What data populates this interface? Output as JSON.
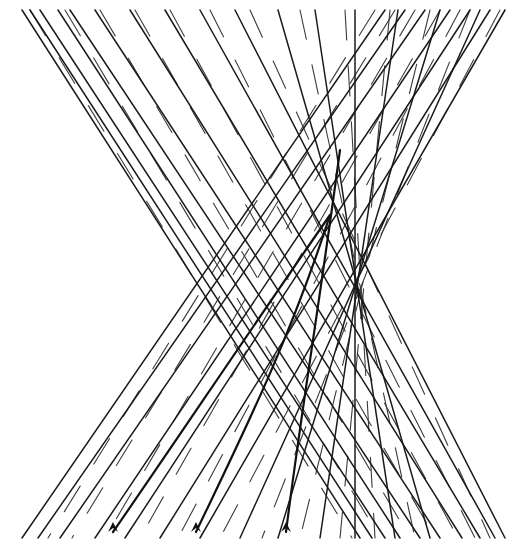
{
  "figure": {
    "title": "Hyperboloid of one sheet as a ruled surface",
    "width": 524,
    "height": 560,
    "top_y": 10,
    "bottom_y": 538,
    "waist_y": 278,
    "colors": {
      "line": "#1a1a1a",
      "background": "#ffffff"
    },
    "front_rulings": [
      [
        22,
        10,
        360,
        538
      ],
      [
        30,
        10,
        372,
        538
      ],
      [
        40,
        10,
        385,
        538
      ],
      [
        58,
        10,
        400,
        538
      ],
      [
        70,
        10,
        420,
        538
      ],
      [
        95,
        10,
        440,
        538
      ],
      [
        130,
        10,
        462,
        538
      ],
      [
        165,
        10,
        480,
        538
      ],
      [
        200,
        10,
        495,
        538
      ],
      [
        235,
        10,
        505,
        538
      ],
      [
        278,
        10,
        430,
        538
      ],
      [
        315,
        10,
        395,
        538
      ],
      [
        355,
        10,
        355,
        538
      ],
      [
        398,
        10,
        320,
        538
      ],
      [
        440,
        10,
        278,
        538
      ],
      [
        480,
        10,
        240,
        538
      ],
      [
        505,
        10,
        200,
        538
      ],
      [
        490,
        10,
        160,
        538
      ],
      [
        470,
        10,
        125,
        538
      ],
      [
        450,
        10,
        95,
        538
      ],
      [
        425,
        10,
        60,
        538
      ],
      [
        405,
        10,
        38,
        538
      ],
      [
        385,
        10,
        22,
        538
      ]
    ],
    "back_rulings": [
      [
        30,
        10,
        352,
        538
      ],
      [
        65,
        10,
        380,
        538
      ],
      [
        100,
        10,
        410,
        538
      ],
      [
        135,
        10,
        435,
        538
      ],
      [
        170,
        10,
        458,
        538
      ],
      [
        210,
        10,
        475,
        538
      ],
      [
        250,
        10,
        490,
        538
      ],
      [
        300,
        10,
        415,
        538
      ],
      [
        345,
        10,
        375,
        538
      ],
      [
        390,
        10,
        340,
        538
      ],
      [
        430,
        10,
        300,
        538
      ],
      [
        470,
        10,
        262,
        538
      ],
      [
        500,
        10,
        220,
        538
      ],
      [
        460,
        10,
        178,
        538
      ],
      [
        440,
        10,
        140,
        538
      ],
      [
        415,
        10,
        105,
        538
      ],
      [
        395,
        10,
        72,
        538
      ],
      [
        375,
        10,
        48,
        538
      ]
    ],
    "heavy_curves": [
      {
        "path": "M113,532 C170,450 250,330 330,215",
        "arrow_at": [
          113,
          532
        ]
      },
      {
        "path": "M196,532 C240,440 290,340 330,215",
        "arrow_at": [
          196,
          532
        ]
      },
      {
        "path": "M286,532 C300,420 320,300 340,150",
        "arrow_at": [
          286,
          532
        ]
      }
    ]
  }
}
